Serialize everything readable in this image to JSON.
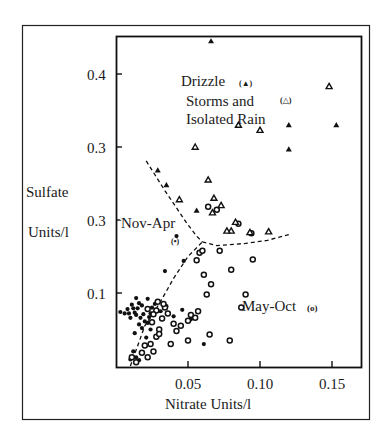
{
  "chart_data": {
    "type": "scatter",
    "title": "",
    "xlabel": "Nitrate Units/l",
    "ylabel_lines": [
      "Sulfate",
      "Units/l"
    ],
    "xlim": [
      0,
      0.17
    ],
    "ylim": [
      0,
      0.45
    ],
    "grid": false,
    "x_ticks": [
      {
        "value": 0.05,
        "label": "0.05"
      },
      {
        "value": 0.1,
        "label": "0.10"
      },
      {
        "value": 0.15,
        "label": "0.15"
      }
    ],
    "y_ticks": [
      {
        "value": 0.1,
        "label": "0.1"
      },
      {
        "value": 0.2,
        "label": "0.3"
      },
      {
        "value": 0.3,
        "label": "0.3"
      },
      {
        "value": 0.4,
        "label": "0.4"
      }
    ],
    "annotations": [
      {
        "text": "Drizzle",
        "marker": "(▲)"
      },
      {
        "text": "Storms and",
        "marker": "(△)"
      },
      {
        "text": "Isolated Rain"
      },
      {
        "text": "Nov-Apr",
        "marker": "(•)"
      },
      {
        "text": "May-Oct",
        "marker": "(o)"
      }
    ],
    "legend": {
      "position": "inline annotations"
    },
    "series": [
      {
        "name": "Nov-Apr",
        "marker": "filled-circle",
        "points": [
          [
            0.003,
            0.074
          ],
          [
            0.006,
            0.072
          ],
          [
            0.008,
            0.078
          ],
          [
            0.009,
            0.072
          ],
          [
            0.01,
            0.066
          ],
          [
            0.011,
            0.084
          ],
          [
            0.012,
            0.079
          ],
          [
            0.013,
            0.073
          ],
          [
            0.014,
            0.07
          ],
          [
            0.014,
            0.093
          ],
          [
            0.015,
            0.079
          ],
          [
            0.016,
            0.086
          ],
          [
            0.017,
            0.066
          ],
          [
            0.018,
            0.083
          ],
          [
            0.019,
            0.071
          ],
          [
            0.02,
            0.061
          ],
          [
            0.022,
            0.059
          ],
          [
            0.024,
            0.072
          ],
          [
            0.016,
            0.057
          ],
          [
            0.018,
            0.052
          ],
          [
            0.013,
            0.045
          ],
          [
            0.025,
            0.08
          ],
          [
            0.027,
            0.085
          ],
          [
            0.023,
            0.067
          ],
          [
            0.021,
            0.039
          ],
          [
            0.012,
            0.02
          ],
          [
            0.014,
            0.012
          ],
          [
            0.016,
            0.008
          ],
          [
            0.024,
            0.05
          ],
          [
            0.035,
            0.082
          ],
          [
            0.04,
            0.068
          ],
          [
            0.046,
            0.077
          ],
          [
            0.052,
            0.064
          ],
          [
            0.034,
            0.13
          ],
          [
            0.047,
            0.144
          ],
          [
            0.042,
            0.178
          ],
          [
            0.061,
            0.03
          ],
          [
            0.01,
            0.009
          ],
          [
            0.022,
            0.092
          ],
          [
            0.031,
            0.075
          ]
        ]
      },
      {
        "name": "May-Oct",
        "marker": "open-circle",
        "points": [
          [
            0.011,
            0.012
          ],
          [
            0.014,
            0.005
          ],
          [
            0.018,
            0.018
          ],
          [
            0.02,
            0.028
          ],
          [
            0.022,
            0.012
          ],
          [
            0.024,
            0.03
          ],
          [
            0.026,
            0.02
          ],
          [
            0.028,
            0.04
          ],
          [
            0.025,
            0.06
          ],
          [
            0.028,
            0.076
          ],
          [
            0.03,
            0.05
          ],
          [
            0.032,
            0.065
          ],
          [
            0.034,
            0.08
          ],
          [
            0.036,
            0.072
          ],
          [
            0.029,
            0.088
          ],
          [
            0.033,
            0.085
          ],
          [
            0.03,
            0.044
          ],
          [
            0.038,
            0.03
          ],
          [
            0.026,
            0.071
          ],
          [
            0.022,
            0.078
          ],
          [
            0.04,
            0.058
          ],
          [
            0.045,
            0.055
          ],
          [
            0.042,
            0.048
          ],
          [
            0.05,
            0.062
          ],
          [
            0.052,
            0.07
          ],
          [
            0.055,
            0.066
          ],
          [
            0.057,
            0.075
          ],
          [
            0.063,
            0.098
          ],
          [
            0.066,
            0.112
          ],
          [
            0.061,
            0.125
          ],
          [
            0.058,
            0.155
          ],
          [
            0.056,
            0.145
          ],
          [
            0.06,
            0.158
          ],
          [
            0.08,
            0.132
          ],
          [
            0.072,
            0.158
          ],
          [
            0.09,
            0.098
          ],
          [
            0.05,
            0.035
          ],
          [
            0.065,
            0.043
          ],
          [
            0.064,
            0.218
          ],
          [
            0.085,
            0.195
          ],
          [
            0.094,
            0.182
          ],
          [
            0.095,
            0.146
          ],
          [
            0.07,
            0.214
          ],
          [
            0.079,
            0.035
          ],
          [
            0.087,
            0.08
          ]
        ]
      },
      {
        "name": "Drizzle",
        "marker": "filled-triangle",
        "points": [
          [
            0.066,
            0.445
          ],
          [
            0.153,
            0.33
          ],
          [
            0.12,
            0.33
          ],
          [
            0.12,
            0.297
          ],
          [
            0.029,
            0.268
          ],
          [
            0.035,
            0.248
          ],
          [
            0.056,
            0.213
          ]
        ]
      },
      {
        "name": "Storms and Isolated Rain",
        "marker": "open-triangle",
        "points": [
          [
            0.148,
            0.383
          ],
          [
            0.085,
            0.33
          ],
          [
            0.1,
            0.323
          ],
          [
            0.073,
            0.22
          ],
          [
            0.064,
            0.255
          ],
          [
            0.044,
            0.228
          ],
          [
            0.067,
            0.21
          ],
          [
            0.083,
            0.197
          ],
          [
            0.08,
            0.185
          ],
          [
            0.093,
            0.183
          ],
          [
            0.106,
            0.184
          ],
          [
            0.077,
            0.185
          ],
          [
            0.055,
            0.3
          ],
          [
            0.068,
            0.23
          ]
        ]
      }
    ],
    "reference_lines": [
      {
        "name": "dividing-line-upper",
        "style": "dashed",
        "points": [
          [
            0.021,
            0.281
          ],
          [
            0.034,
            0.24
          ],
          [
            0.049,
            0.196
          ],
          [
            0.056,
            0.178
          ],
          [
            0.06,
            0.17
          ]
        ]
      },
      {
        "name": "dividing-line-right",
        "style": "dashed",
        "points": [
          [
            0.06,
            0.17
          ],
          [
            0.07,
            0.165
          ],
          [
            0.09,
            0.168
          ],
          [
            0.105,
            0.172
          ],
          [
            0.12,
            0.18
          ]
        ]
      },
      {
        "name": "dividing-line-lower",
        "style": "dashed",
        "points": [
          [
            0.01,
            0.0
          ],
          [
            0.02,
            0.055
          ],
          [
            0.03,
            0.085
          ],
          [
            0.04,
            0.12
          ],
          [
            0.05,
            0.15
          ],
          [
            0.06,
            0.17
          ]
        ]
      }
    ]
  },
  "labels": {
    "drizzle": "Drizzle",
    "drizzle_marker": "(▲)",
    "storms": "Storms and",
    "storms_marker": "(△)",
    "isolated": "Isolated Rain",
    "nov_apr": "Nov-Apr",
    "nov_apr_marker": "(•)",
    "may_oct": "May-Oct",
    "may_oct_marker": "(o)",
    "ylabel_top": "Sulfate",
    "ylabel_bottom": "Units/l",
    "xlabel": "Nitrate Units/l"
  }
}
